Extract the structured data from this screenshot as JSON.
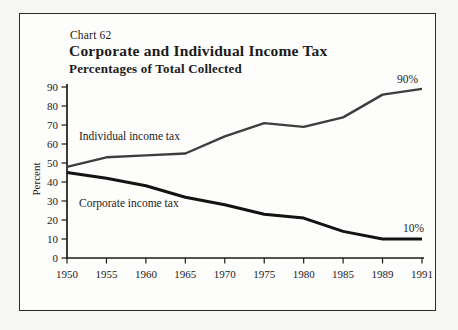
{
  "figure": {
    "chart_label": "Chart 62",
    "title": "Corporate and Individual Income Tax",
    "subtitle": "Percentages of Total Collected",
    "y_axis_label": "Percent",
    "annotation_top": "90%",
    "annotation_bottom": "10%",
    "series_label_individual": "Individual income tax",
    "series_label_corporate": "Corporate income tax",
    "ink_color": "#1b1b1b",
    "background_color": "#fdfdfb"
  },
  "chart_data": {
    "type": "line",
    "chart_number": "Chart 62",
    "title": "Corporate and Individual Income Tax",
    "subtitle": "Percentages of Total Collected",
    "xlabel": "",
    "ylabel": "Percent",
    "categories": [
      "1950",
      "1955",
      "1960",
      "1965",
      "1970",
      "1975",
      "1980",
      "1985",
      "1989",
      "1991"
    ],
    "y_ticks": [
      0,
      10,
      20,
      30,
      40,
      50,
      60,
      70,
      80,
      90
    ],
    "ylim": [
      0,
      90
    ],
    "grid": false,
    "legend_position": "inline-labels",
    "series": [
      {
        "name": "Individual income tax",
        "values": [
          48,
          53,
          54,
          55,
          64,
          71,
          69,
          74,
          86,
          89
        ],
        "end_label": "90%",
        "color": "#3d3d3d",
        "width": 2.4
      },
      {
        "name": "Corporate income tax",
        "values": [
          45,
          42,
          38,
          32,
          28,
          23,
          21,
          14,
          10,
          10
        ],
        "end_label": "10%",
        "color": "#131313",
        "width": 3
      }
    ]
  }
}
